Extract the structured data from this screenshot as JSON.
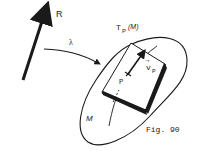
{
  "diagram": {
    "real_line_label": "R",
    "map_label": "λ",
    "tangent_space_label": "T",
    "tangent_space_sub": "P",
    "tangent_space_arg": "(M)",
    "point_label": "P",
    "vector_label": "v",
    "vector_sub": "P",
    "vector_arrow": "→",
    "manifold_label": "M",
    "caption": "Fig. 90"
  },
  "colors": {
    "ink": "#1a1a1a",
    "background": "#ffffff"
  }
}
